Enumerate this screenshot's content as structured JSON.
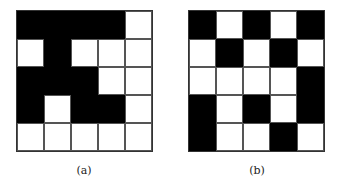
{
  "figures": [
    {
      "label": "(a)",
      "rows": [
        [
          1,
          1,
          1,
          1,
          0
        ],
        [
          0,
          1,
          0,
          0,
          0
        ],
        [
          1,
          1,
          1,
          0,
          0
        ],
        [
          1,
          0,
          1,
          1,
          0
        ],
        [
          0,
          0,
          0,
          0,
          0
        ]
      ]
    },
    {
      "label": "(b)",
      "rows": [
        [
          1,
          0,
          1,
          0,
          1
        ],
        [
          0,
          1,
          0,
          1,
          0
        ],
        [
          0,
          0,
          0,
          0,
          1
        ],
        [
          1,
          0,
          1,
          0,
          1
        ],
        [
          1,
          0,
          0,
          1,
          0
        ]
      ]
    }
  ],
  "colors": {
    "filled": "#000000",
    "empty": "#ffffff"
  }
}
